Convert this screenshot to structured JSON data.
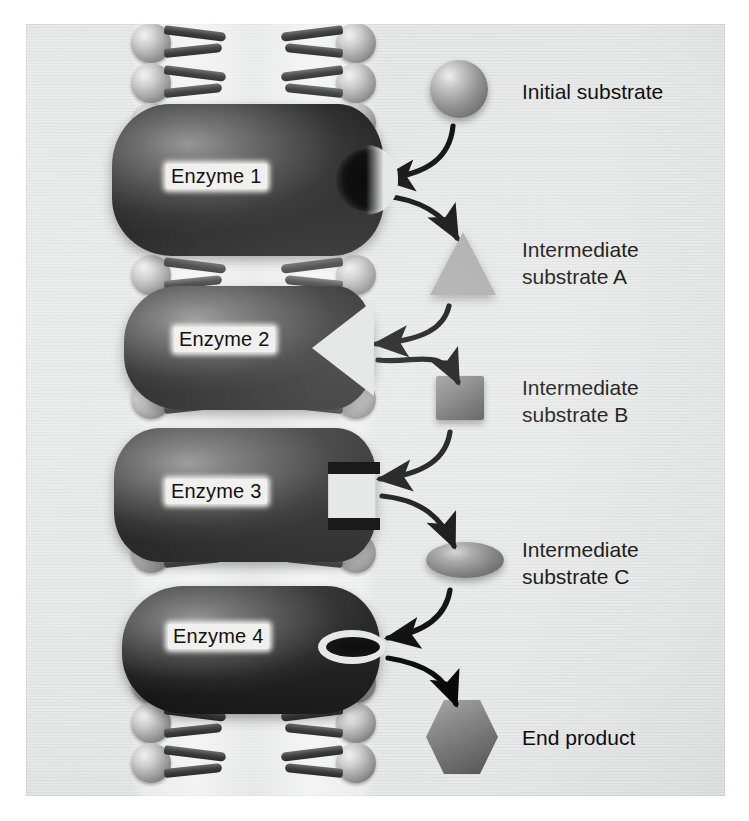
{
  "figure": {
    "background_color": "#e6e7e7",
    "ink_color": "#111111"
  },
  "membrane": {
    "name": "phospholipid-bilayer",
    "lipid_rows": 24,
    "head_color": "#9a9a9a",
    "tail_color": "#333333"
  },
  "enzymes": [
    {
      "label": "Enzyme 1",
      "notch": "circular",
      "color": "#2b2b2b"
    },
    {
      "label": "Enzyme 2",
      "notch": "triangular",
      "color": "#2b2b2b"
    },
    {
      "label": "Enzyme 3",
      "notch": "square",
      "color": "#2b2b2b"
    },
    {
      "label": "Enzyme 4",
      "notch": "elliptical-slit",
      "color": "#2b2b2b"
    }
  ],
  "substrates": [
    {
      "label": "Initial substrate",
      "shape": "sphere",
      "color": "#8e8e8e"
    },
    {
      "label": "Intermediate\nsubstrate A",
      "shape": "triangle",
      "color": "#a8a8a8"
    },
    {
      "label": "Intermediate\nsubstrate B",
      "shape": "square",
      "color": "#6f6f6f"
    },
    {
      "label": "Intermediate\nsubstrate C",
      "shape": "ellipse",
      "color": "#808080"
    },
    {
      "label": "End product",
      "shape": "hexagon",
      "color": "#7d7d7d"
    }
  ],
  "arrows": {
    "count": 8,
    "color": "#000000",
    "description": "Curved arrows alternating into each enzyme active site and out to the next substrate"
  }
}
